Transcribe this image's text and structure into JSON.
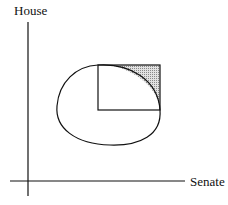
{
  "diagram": {
    "y_axis_label": "House",
    "x_axis_label": "Senate",
    "colors": {
      "line": "#111111",
      "shade": "#bdbdbd"
    },
    "elements": [
      "axes",
      "oval win-set",
      "square quadrant",
      "shaded lens region"
    ]
  }
}
